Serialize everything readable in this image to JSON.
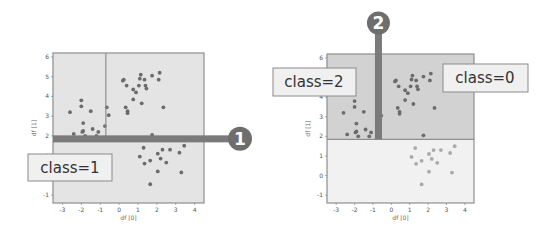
{
  "colors": {
    "region_dark": "#d2d2d2",
    "region_light": "#f1f1f1",
    "region_left": "#e4e4e4",
    "frame": "#8e8e8e",
    "split_bar": "#7a7a7a",
    "point_dark": "#6b6b6b",
    "point_light": "#a9a9a9",
    "badge": "#6e6e6e",
    "callout_fill": "#f0f0f0",
    "callout_border": "#8a8a8a"
  },
  "charts": [
    {
      "id": "left",
      "xlabel": "df [0]",
      "ylabel": "df [1]",
      "xticks": [
        "-3",
        "-2",
        "-1",
        "0",
        "1",
        "2",
        "3",
        "4"
      ],
      "yticks": [
        "-1",
        "0",
        "1",
        "2",
        "3",
        "4",
        "5",
        "6"
      ],
      "xlim": [
        -3.5,
        4.5
      ],
      "ylim": [
        -1.4,
        6.2
      ],
      "split_thick": {
        "axis": "y",
        "value": 1.85,
        "badge": "1"
      },
      "split_thin": {
        "axis": "x",
        "value": -0.7,
        "ymin": 1.85
      },
      "callout": {
        "label": "class=1"
      }
    },
    {
      "id": "right",
      "xlabel": "df [0]",
      "ylabel": "df [1]",
      "xticks": [
        "-3",
        "-2",
        "-1",
        "0",
        "1",
        "2",
        "3",
        "4"
      ],
      "yticks": [
        "-1",
        "0",
        "1",
        "2",
        "3",
        "4",
        "5",
        "6"
      ],
      "xlim": [
        -3.5,
        4.5
      ],
      "ylim": [
        -1.4,
        6.2
      ],
      "split_thin": {
        "axis": "y",
        "value": 1.85
      },
      "split_thick": {
        "axis": "x",
        "value": -0.7,
        "badge": "2",
        "ymin": 1.85
      },
      "callouts": [
        {
          "label": "class=2"
        },
        {
          "label": "class=0"
        }
      ]
    }
  ],
  "chart_data": {
    "type": "scatter",
    "title": "",
    "xlabel": "df [0]",
    "ylabel": "df [1]",
    "xlim": [
      -3.5,
      4.5
    ],
    "ylim": [
      -1.4,
      6.2
    ],
    "series": [
      {
        "name": "class=2",
        "points": [
          [
            -2.6,
            3.2
          ],
          [
            -2.4,
            2.1
          ],
          [
            -2.0,
            3.8
          ],
          [
            -2.0,
            3.5
          ],
          [
            -1.9,
            2.65
          ],
          [
            -1.9,
            2.25
          ],
          [
            -1.95,
            2.2
          ],
          [
            -1.5,
            3.25
          ],
          [
            -1.4,
            2.35
          ],
          [
            -1.1,
            2.2
          ],
          [
            -1.2,
            2.0
          ],
          [
            -0.75,
            2.5
          ],
          [
            -0.65,
            3.45
          ],
          [
            -0.55,
            3.05
          ],
          [
            -1.8,
            2.0
          ]
        ]
      },
      {
        "name": "class=0",
        "points": [
          [
            0.2,
            4.8
          ],
          [
            0.25,
            4.85
          ],
          [
            0.4,
            4.55
          ],
          [
            0.75,
            4.35
          ],
          [
            0.9,
            4.2
          ],
          [
            1.05,
            4.55
          ],
          [
            1.1,
            4.9
          ],
          [
            1.15,
            5.1
          ],
          [
            1.35,
            4.85
          ],
          [
            1.4,
            4.55
          ],
          [
            1.45,
            4.4
          ],
          [
            1.75,
            5.05
          ],
          [
            2.1,
            4.85
          ],
          [
            2.15,
            5.2
          ],
          [
            0.75,
            3.85
          ],
          [
            1.2,
            3.65
          ],
          [
            0.35,
            3.45
          ],
          [
            0.45,
            3.25
          ],
          [
            0.45,
            3.15
          ],
          [
            2.35,
            3.45
          ],
          [
            1.75,
            2.05
          ]
        ]
      },
      {
        "name": "class=1",
        "points": [
          [
            1.3,
            1.4
          ],
          [
            1.1,
            0.95
          ],
          [
            1.35,
            0.6
          ],
          [
            1.65,
            0.75
          ],
          [
            2.05,
            1.1
          ],
          [
            2.3,
            1.3
          ],
          [
            2.2,
            0.85
          ],
          [
            2.5,
            0.65
          ],
          [
            2.7,
            1.3
          ],
          [
            3.2,
            1.15
          ],
          [
            3.45,
            1.5
          ],
          [
            2.05,
            0.2
          ],
          [
            1.65,
            -0.45
          ],
          [
            3.3,
            0.15
          ]
        ]
      }
    ],
    "thresholds": [
      {
        "split": 1,
        "feature": "df [1]",
        "value": 1.85
      },
      {
        "split": 2,
        "feature": "df [0]",
        "value": -0.7
      }
    ],
    "annotations": [
      "1",
      "2",
      "class=1",
      "class=2",
      "class=0"
    ]
  }
}
